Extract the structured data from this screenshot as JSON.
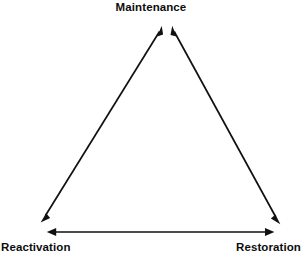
{
  "diagram": {
    "type": "triangle-relationship-diagram",
    "background_color": "#ffffff",
    "ink_color": "#111111",
    "nodes": [
      {
        "id": "maintenance",
        "label": "Maintenance",
        "position": "top",
        "x": 166,
        "y": 25
      },
      {
        "id": "reactivation",
        "label": "Reactivation",
        "position": "bottom-left",
        "x": 41,
        "y": 224
      },
      {
        "id": "restoration",
        "label": "Restoration",
        "position": "bottom-right",
        "x": 280,
        "y": 224
      }
    ],
    "edges": [
      {
        "id": "reactivation-maintenance",
        "from": "reactivation",
        "to": "maintenance",
        "arrowheads": "both",
        "x1": 41,
        "y1": 222,
        "x2": 162,
        "y2": 26
      },
      {
        "id": "maintenance-restoration",
        "from": "maintenance",
        "to": "restoration",
        "arrowheads": "both",
        "x1": 172,
        "y1": 26,
        "x2": 280,
        "y2": 223
      },
      {
        "id": "reactivation-restoration",
        "from": "reactivation",
        "to": "restoration",
        "arrowheads": "both",
        "x1": 47,
        "y1": 232,
        "x2": 274,
        "y2": 232
      }
    ]
  }
}
